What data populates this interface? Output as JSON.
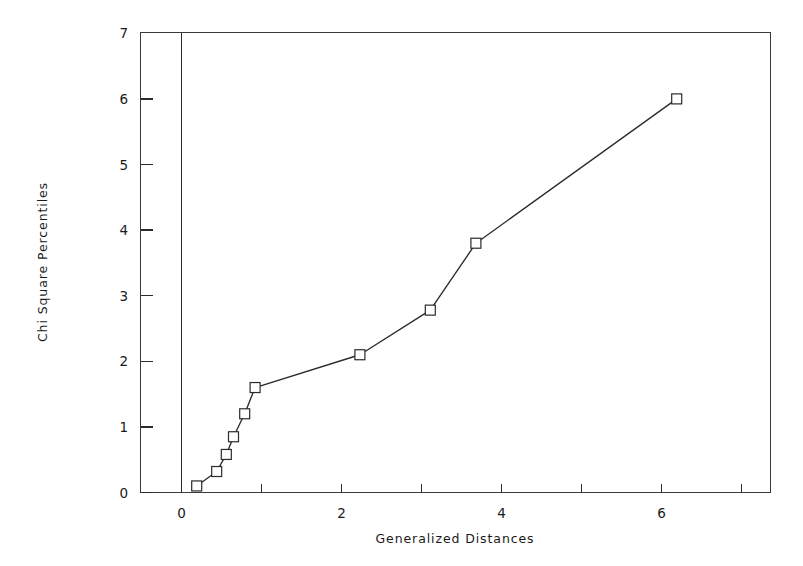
{
  "chart_data": {
    "type": "line",
    "title": "",
    "xlabel": "Generalized Distances",
    "ylabel": "Chi Square Percentiles",
    "xlim": [
      -0.35,
      7.45
    ],
    "ylim": [
      0,
      7
    ],
    "grid": false,
    "legend": null,
    "marker": "open-square",
    "x_ticks": [
      0,
      1,
      2,
      3,
      4,
      5,
      6,
      7
    ],
    "x_tick_labels": [
      "0",
      "",
      "2",
      "",
      "4",
      "",
      "6",
      ""
    ],
    "y_ticks": [
      0,
      1,
      2,
      3,
      4,
      5,
      6,
      7
    ],
    "y_tick_labels": [
      "0",
      "1",
      "2",
      "3",
      "4",
      "5",
      "6",
      "7"
    ],
    "series": [
      {
        "name": "Chi Square Q-Q",
        "x": [
          0.19,
          0.44,
          0.56,
          0.65,
          0.79,
          0.92,
          2.23,
          3.11,
          3.68,
          6.19
        ],
        "y": [
          0.1,
          0.32,
          0.58,
          0.85,
          1.2,
          1.6,
          2.1,
          2.78,
          3.8,
          6.0
        ]
      }
    ],
    "colors": {
      "line": "#2b2b2b",
      "marker_fill": "#ffffff",
      "marker_edge": "#2b2b2b",
      "axis": "#2b2b2b",
      "background": "#ffffff"
    }
  },
  "labels": {
    "x_axis_title": "Generalized Distances",
    "y_axis_title": "Chi Square Percentiles"
  }
}
